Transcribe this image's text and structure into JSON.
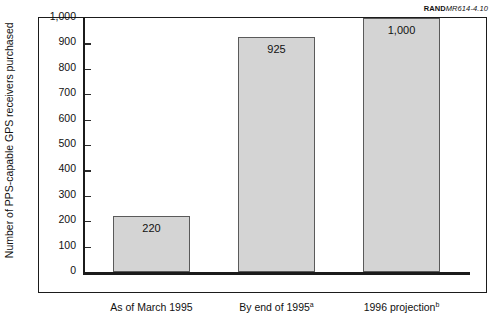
{
  "source_credit": {
    "rand": "RAND",
    "document": "MR614-4.10"
  },
  "chart_data": {
    "type": "bar",
    "title": "",
    "xlabel": "",
    "ylabel": "Number of PPS-capable GPS receivers purchased",
    "categories": [
      "As of March 1995",
      "By end of 1995",
      "1996 projection"
    ],
    "category_footnotes": [
      "",
      "a",
      "b"
    ],
    "values": [
      220,
      925,
      1000
    ],
    "value_labels": [
      "220",
      "925",
      "1,000"
    ],
    "ylim": [
      0,
      1000
    ],
    "ytick_values": [
      0,
      100,
      200,
      300,
      400,
      500,
      600,
      700,
      800,
      900,
      1000
    ],
    "ytick_labels": [
      "0",
      "100",
      "200",
      "300",
      "400",
      "500",
      "600",
      "700",
      "800",
      "900",
      "1,000"
    ],
    "grid": false,
    "legend": "none",
    "bar_fill_color": "#d4d4d4",
    "bar_edge_color": "#5a5a5a",
    "axis_color": "#1b1b1b"
  }
}
